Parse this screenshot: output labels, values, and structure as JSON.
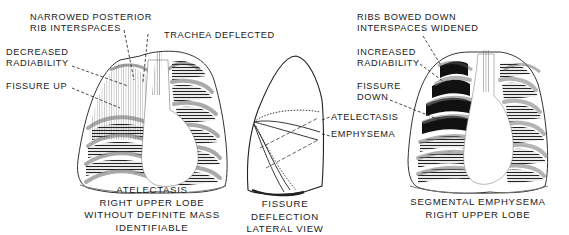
{
  "figure": {
    "panels": [
      {
        "id": "left",
        "view": "PA chest",
        "caption": [
          "ATELECTASIS",
          "RIGHT UPPER LOBE",
          "WITHOUT DEFINITE MASS",
          "IDENTIFIABLE"
        ],
        "labels": [
          {
            "lines": [
              "NARROWED POSTERIOR",
              "RIB INTERSPACES"
            ]
          },
          {
            "lines": [
              "TRACHEA DEFLECTED"
            ]
          },
          {
            "lines": [
              "DECREASED",
              "RADIABILITY"
            ]
          },
          {
            "lines": [
              "FISSURE UP"
            ]
          }
        ]
      },
      {
        "id": "middle",
        "view": "lateral lung",
        "caption": [
          "FISSURE",
          "DEFLECTION",
          "LATERAL VIEW"
        ],
        "labels": [
          {
            "lines": [
              "ATELECTASIS"
            ]
          },
          {
            "lines": [
              "EMPHYSEMA"
            ]
          }
        ]
      },
      {
        "id": "right",
        "view": "PA chest",
        "caption": [
          "SEGMENTAL EMPHYSEMA",
          "RIGHT UPPER LOBE"
        ],
        "labels": [
          {
            "lines": [
              "RIBS BOWED DOWN",
              "INTERSPACES WIDENED"
            ]
          },
          {
            "lines": [
              "INCREASED",
              "RADIABILITY"
            ]
          },
          {
            "lines": [
              "FISSURE",
              "DOWN"
            ]
          }
        ]
      }
    ],
    "colors": {
      "ink": "#1a1a1a",
      "paper": "#ffffff",
      "rib_fill": "#d8d8d8"
    }
  }
}
